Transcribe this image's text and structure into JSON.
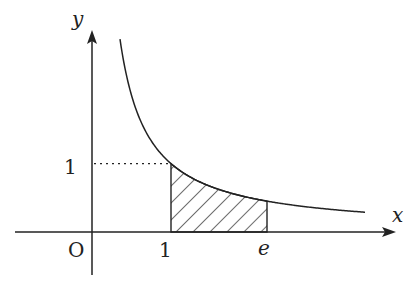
{
  "chart_data": {
    "type": "line",
    "function": "y = 1/x",
    "title": "",
    "xlabel": "x",
    "ylabel": "y",
    "origin_label": "O",
    "x_tick_labels": [
      "1",
      "e"
    ],
    "y_tick_labels": [
      "1"
    ],
    "shaded_region": {
      "from": "1",
      "to": "e",
      "under": "curve",
      "pattern": "hatched"
    },
    "guide_line": {
      "style": "dotted",
      "from_axis": "y",
      "at_y": 1,
      "to_x": 1
    },
    "x_domain": [
      0.35,
      3.5
    ]
  },
  "colors": {
    "ink": "#222222",
    "background": "#ffffff"
  }
}
